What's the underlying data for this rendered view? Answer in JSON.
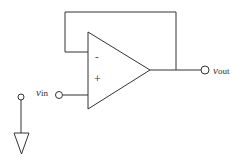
{
  "diagram": {
    "opamp": {
      "inverting_label": "-",
      "noninverting_label": "+"
    },
    "terminals": {
      "input": {
        "label_main": "v",
        "label_sub": "in"
      },
      "output": {
        "label_main": "v",
        "label_sub": "out"
      }
    },
    "colors": {
      "stroke": "#333333",
      "background": "#ffffff"
    }
  }
}
